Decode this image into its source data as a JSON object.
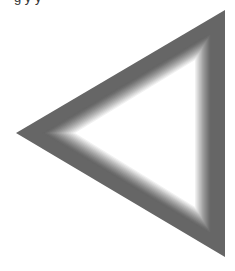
{
  "caption": {
    "text": "g                    y  y",
    "note": "clipped"
  },
  "shape": {
    "type": "triangle",
    "direction": "left",
    "outer_vertices": [
      [
        16,
        133
      ],
      [
        225,
        10
      ],
      [
        225,
        257
      ]
    ],
    "inner_vertices": [
      [
        75,
        133
      ],
      [
        195,
        60
      ],
      [
        195,
        207
      ]
    ],
    "edge_color": "#666666",
    "center_color": "#ffffff",
    "bands": 14
  }
}
